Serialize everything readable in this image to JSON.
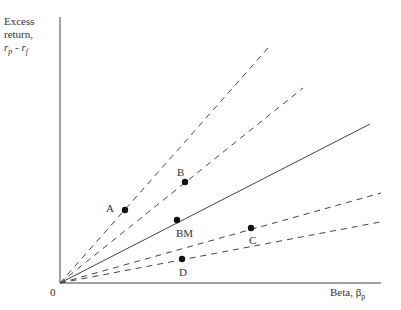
{
  "y_axis_label": {
    "line1": "Excess",
    "line2": "return,",
    "line3": "r_p - r_f"
  },
  "x_axis_label": "Beta, β_p",
  "origin_label": "0",
  "points": [
    {
      "name": "A",
      "x": 125,
      "y": 210
    },
    {
      "name": "B",
      "x": 185,
      "y": 182
    },
    {
      "name": "BM",
      "x": 177,
      "y": 220
    },
    {
      "name": "C",
      "x": 251,
      "y": 228
    },
    {
      "name": "D",
      "x": 182,
      "y": 259
    }
  ],
  "lines": [
    {
      "through": "A",
      "style": "dashed",
      "end": [
        268,
        48
      ]
    },
    {
      "through": "B",
      "style": "dashed",
      "end": [
        303,
        88
      ]
    },
    {
      "through": "BM",
      "style": "solid",
      "end": [
        370,
        124
      ]
    },
    {
      "through": "C",
      "style": "dashed",
      "end": [
        381,
        193
      ]
    },
    {
      "through": "D",
      "style": "dashed",
      "end": [
        380,
        222
      ]
    }
  ]
}
